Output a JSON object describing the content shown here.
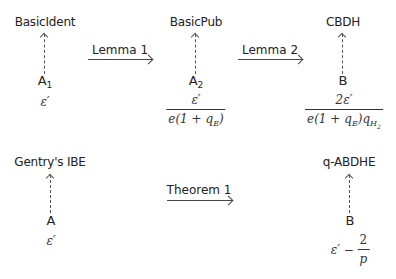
{
  "top_row": {
    "schemes": [
      {
        "name": "BasicIdent",
        "adversary": "A",
        "adversary_sub": "1",
        "advantage": "ε′"
      },
      {
        "name": "BasicPub",
        "adversary": "A",
        "adversary_sub": "2",
        "advantage_num": "ε′",
        "advantage_den": "e(1 + q_E)"
      },
      {
        "name": "CBDH",
        "adversary": "B",
        "adversary_sub": "",
        "advantage_num": "2ε′",
        "advantage_den": "e(1 + q_E)q_H2"
      }
    ],
    "reductions": [
      {
        "label": "Lemma 1"
      },
      {
        "label": "Lemma 2"
      }
    ]
  },
  "bottom_row": {
    "schemes": [
      {
        "name": "Gentry's IBE",
        "adversary": "A",
        "advantage": "ε′"
      },
      {
        "name": "q-ABDHE",
        "adversary": "B",
        "advantage_prefix": "ε′ −",
        "advantage_frac_num": "2",
        "advantage_frac_den": "p"
      }
    ],
    "reductions": [
      {
        "label": "Theorem 1"
      }
    ]
  }
}
